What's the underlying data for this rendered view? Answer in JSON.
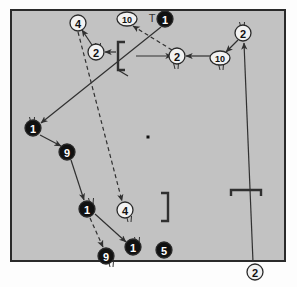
{
  "figure": {
    "title": "",
    "background_color": "#fdfdfd",
    "field_fill": "#c2c2c2",
    "field_stroke": "#2a2a2a",
    "line_color": "#303030",
    "filled_node_fill": "#111111",
    "filled_node_text": "#ffffff",
    "open_node_fill": "#f2f2f2",
    "open_node_text": "#111111"
  },
  "field": {
    "name": "playing-field-rectangle",
    "left": 11,
    "top": 10,
    "right": 285,
    "bottom": 261
  },
  "center_mark": {
    "name": "center-dot",
    "x": 148,
    "y": 137,
    "size": 3
  },
  "brackets": [
    {
      "name": "bracket-left-open",
      "shape": "[",
      "x": 118,
      "y": 42,
      "height": 28,
      "arm": 7
    },
    {
      "name": "bracket-center-close",
      "shape": "]",
      "x": 168,
      "y": 193,
      "height": 28,
      "arm": 7
    },
    {
      "name": "bracket-right-cap",
      "shape": "cap",
      "x": 231,
      "y": 190,
      "width": 30,
      "arm": 6
    }
  ],
  "tick_marks": [
    {
      "name": "tick-top-t",
      "label": "T",
      "x": 152,
      "y": 18
    }
  ],
  "nodes": [
    {
      "id": "n1",
      "name": "node-4-top-left",
      "label": "4",
      "style": "open",
      "shape": "circle",
      "x": 78,
      "y": 23,
      "r": 8
    },
    {
      "id": "n2",
      "name": "node-2-upper-left",
      "label": "2",
      "style": "open",
      "shape": "circle",
      "x": 96,
      "y": 52,
      "r": 8
    },
    {
      "id": "n3",
      "name": "node-10-top",
      "label": "10",
      "style": "open",
      "shape": "ellipse",
      "x": 127,
      "y": 19,
      "rx": 10,
      "ry": 7
    },
    {
      "id": "n4",
      "name": "node-1-top",
      "label": "1",
      "style": "filled",
      "shape": "circle",
      "x": 165,
      "y": 19,
      "r": 8
    },
    {
      "id": "n5",
      "name": "node-2-center-right",
      "label": "2",
      "style": "open",
      "shape": "circle",
      "x": 177,
      "y": 56,
      "r": 8
    },
    {
      "id": "n6",
      "name": "node-10-right",
      "label": "10",
      "style": "open",
      "shape": "ellipse",
      "x": 220,
      "y": 58,
      "rx": 10,
      "ry": 7
    },
    {
      "id": "n7",
      "name": "node-2-top-right",
      "label": "2",
      "style": "open",
      "shape": "circle",
      "x": 243,
      "y": 33,
      "r": 8
    },
    {
      "id": "n8",
      "name": "node-1-mid-left",
      "label": "1",
      "style": "filled",
      "shape": "circle",
      "x": 33,
      "y": 128,
      "r": 8
    },
    {
      "id": "n9",
      "name": "node-9-left",
      "label": "9",
      "style": "filled",
      "shape": "circle",
      "x": 67,
      "y": 152,
      "r": 8
    },
    {
      "id": "n10",
      "name": "node-1-lower-left",
      "label": "1",
      "style": "filled",
      "shape": "circle",
      "x": 87,
      "y": 209,
      "r": 8
    },
    {
      "id": "n11",
      "name": "node-4-lower",
      "label": "4",
      "style": "open",
      "shape": "circle",
      "x": 125,
      "y": 210,
      "r": 8
    },
    {
      "id": "n12",
      "name": "node-9-bottom",
      "label": "9",
      "style": "filled",
      "shape": "circle",
      "x": 106,
      "y": 256,
      "r": 8
    },
    {
      "id": "n13",
      "name": "node-1-bottom",
      "label": "1",
      "style": "filled",
      "shape": "circle",
      "x": 133,
      "y": 247,
      "r": 8
    },
    {
      "id": "n14",
      "name": "node-5-bottom",
      "label": "5",
      "style": "filled",
      "shape": "circle",
      "x": 164,
      "y": 250,
      "r": 8
    },
    {
      "id": "n15",
      "name": "node-2-bottom-outside",
      "label": "2",
      "style": "open",
      "shape": "circle",
      "x": 255,
      "y": 272,
      "r": 8
    }
  ],
  "arrows": [
    {
      "name": "arrow-2-to-4-upper-left",
      "style": "solid",
      "from": [
        92,
        45
      ],
      "to": [
        82,
        30
      ]
    },
    {
      "name": "arrow-2-to-2-upper-left",
      "style": "solid",
      "from": [
        116,
        52
      ],
      "to": [
        105,
        52
      ]
    },
    {
      "name": "arrow-2-to-10-top",
      "style": "dashed",
      "from": [
        172,
        50
      ],
      "to": [
        133,
        26
      ]
    },
    {
      "name": "arrow-1-top-to-1-mid-left",
      "style": "solid",
      "from": [
        161,
        27
      ],
      "to": [
        41,
        123
      ]
    },
    {
      "name": "arrow-2-right-to-2-center",
      "style": "solid",
      "from": [
        213,
        56
      ],
      "to": [
        186,
        56
      ]
    },
    {
      "name": "arrow-2-topright-to-10",
      "style": "solid",
      "from": [
        238,
        40
      ],
      "to": [
        226,
        52
      ]
    },
    {
      "name": "arrow-bottom-2-to-topright",
      "style": "solid",
      "from": [
        253,
        262
      ],
      "to": [
        244,
        43
      ]
    },
    {
      "name": "arrow-1-midleft-to-9",
      "style": "solid",
      "from": [
        40,
        135
      ],
      "to": [
        61,
        146
      ]
    },
    {
      "name": "arrow-9-to-1-lowerleft",
      "style": "solid",
      "from": [
        71,
        160
      ],
      "to": [
        84,
        200
      ]
    },
    {
      "name": "arrow-4-top-to-4-lower",
      "style": "dashed",
      "from": [
        78,
        32
      ],
      "to": [
        122,
        201
      ]
    },
    {
      "name": "arrow-1-lowerleft-to-9bot",
      "style": "dashed",
      "from": [
        90,
        218
      ],
      "to": [
        103,
        247
      ]
    },
    {
      "name": "arrow-1-lowerleft-to-1bot",
      "style": "solid",
      "from": [
        95,
        214
      ],
      "to": [
        126,
        242
      ]
    },
    {
      "name": "arrow-2-center-tail",
      "style": "solid",
      "from": [
        136,
        56
      ],
      "to": [
        172,
        56
      ]
    }
  ],
  "free_lines": [
    {
      "name": "line-bracket-crossing",
      "from": [
        118,
        70
      ],
      "to": [
        128,
        76
      ]
    }
  ],
  "whiskers": [
    {
      "name": "whisker-node-2-upper-left",
      "x": 99,
      "y": 45
    },
    {
      "name": "whisker-node-2-center-right",
      "x": 177,
      "y": 65
    },
    {
      "name": "whisker-node-10-right",
      "x": 222,
      "y": 66
    },
    {
      "name": "whisker-node-2-top-right",
      "x": 243,
      "y": 24
    },
    {
      "name": "whisker-node-1-mid-left",
      "x": 33,
      "y": 119
    },
    {
      "name": "whisker-node-1-lower-left",
      "x": 92,
      "y": 200
    },
    {
      "name": "whisker-node-4-lower",
      "x": 130,
      "y": 218
    },
    {
      "name": "whisker-node-9-bottom",
      "x": 112,
      "y": 263
    },
    {
      "name": "whisker-node-1-bottom",
      "x": 138,
      "y": 239
    }
  ]
}
